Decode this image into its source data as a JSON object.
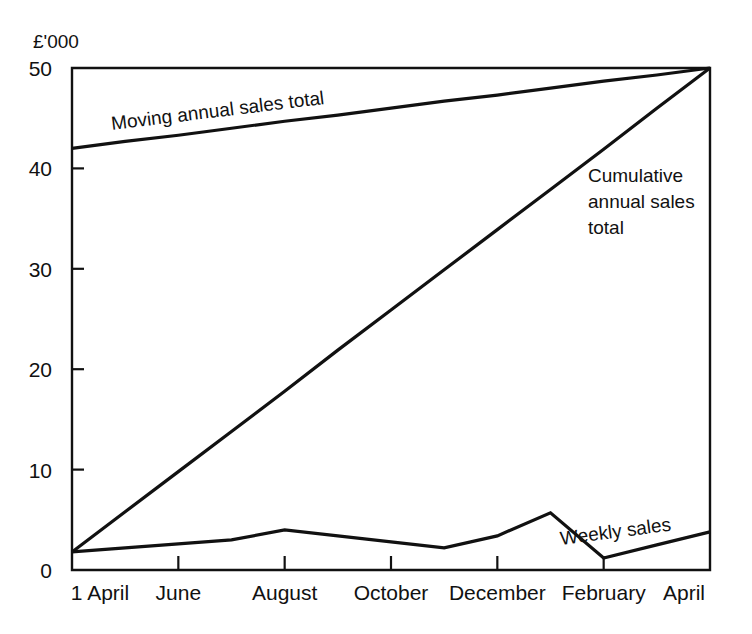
{
  "chart_data": {
    "type": "line",
    "title": "",
    "subtitle": "",
    "ylabel": "£'000",
    "xlabel": "",
    "ylim": [
      0,
      50
    ],
    "yticks": [
      0,
      10,
      20,
      30,
      40,
      50
    ],
    "ytick_labels": [
      "0",
      "10",
      "20",
      "30",
      "40",
      "50"
    ],
    "x": [
      0,
      1,
      2,
      3,
      4,
      5,
      6,
      7,
      8,
      9,
      10,
      11,
      12
    ],
    "xtick_positions": [
      0,
      2,
      4,
      6,
      8,
      10,
      12
    ],
    "xtick_labels": [
      "1 April",
      "June",
      "August",
      "October",
      "December",
      "February",
      "April"
    ],
    "grid": false,
    "legend_position": "inline-annotations",
    "series": [
      {
        "name": "Moving annual sales total",
        "label": "Moving annual sales total",
        "values": [
          42.0,
          42.7,
          43.3,
          44.0,
          44.7,
          45.3,
          46.0,
          46.7,
          47.3,
          48.0,
          48.7,
          49.3,
          50.0
        ]
      },
      {
        "name": "Cumulative annual sales total",
        "label": "Cumulative annual sales total",
        "label_lines": [
          "Cumulative",
          "annual sales",
          "total"
        ],
        "values": [
          1.8,
          5.8,
          9.8,
          13.8,
          17.8,
          21.9,
          25.9,
          29.9,
          33.9,
          37.9,
          41.9,
          46.0,
          50.0
        ]
      },
      {
        "name": "Weekly sales",
        "label": "Weekly sales",
        "values": [
          1.8,
          2.2,
          2.6,
          3.0,
          4.0,
          3.4,
          2.8,
          2.2,
          3.4,
          5.7,
          1.2,
          2.5,
          3.8
        ]
      }
    ],
    "annotations": [
      {
        "text": "Moving annual sales total",
        "series": "Moving annual sales total",
        "rotation": -8
      },
      {
        "text": "Cumulative annual sales total",
        "series": "Cumulative annual sales total",
        "rotation": 0
      },
      {
        "text": "Weekly sales",
        "series": "Weekly sales",
        "rotation": -8
      }
    ],
    "colors": {
      "line": "#111111",
      "axis": "#111111",
      "background": "#ffffff"
    }
  }
}
